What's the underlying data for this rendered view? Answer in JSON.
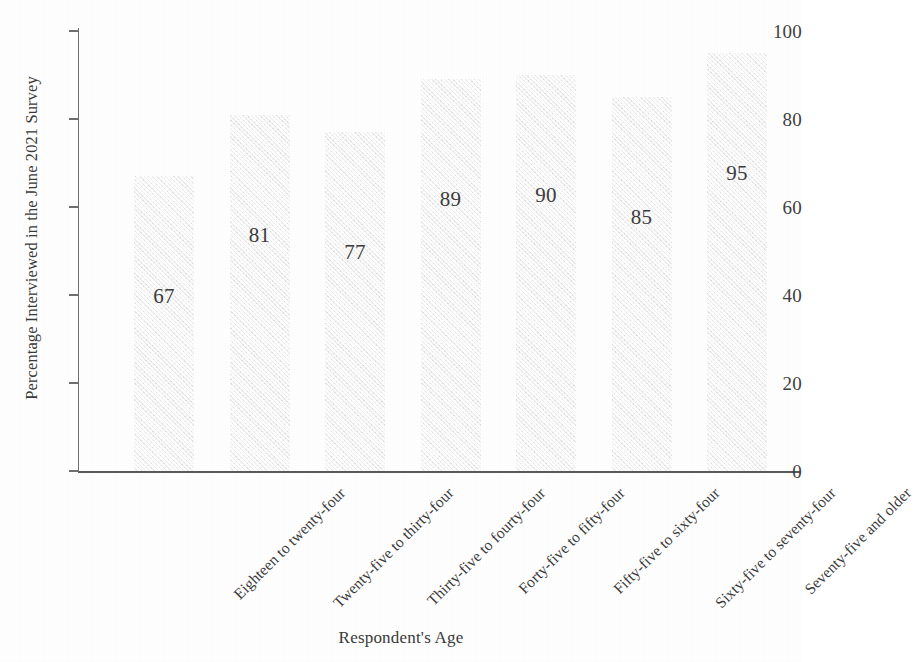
{
  "chart_data": {
    "type": "bar",
    "title": "",
    "xlabel": "Respondent's Age",
    "ylabel": "Percentage Interviewed in the June 2021 Survey",
    "categories": [
      "Eighteen to twenty-four",
      "Twenty-five to thirty-four",
      "Thirty-five to fourty-four",
      "Forty-five to fifty-four",
      "Fifty-five to sixty-four",
      "Sixty-five to seventy-four",
      "Seventy-five and older"
    ],
    "values": [
      67,
      81,
      77,
      89,
      90,
      85,
      95
    ],
    "value_labels": [
      "67",
      "81",
      "77",
      "89",
      "90",
      "85",
      "95"
    ],
    "ylim": [
      0,
      100
    ],
    "y_ticks": [
      0,
      20,
      40,
      60,
      80,
      100
    ],
    "y_tick_labels": [
      "0",
      "20",
      "40",
      "60",
      "80",
      "100"
    ],
    "grid": false,
    "legend": false,
    "legend_position": "none",
    "bar_color": "#ececec",
    "axis_color": "#5a5a5a",
    "text_color": "#3a3a3a",
    "background_color": "#ffffff"
  }
}
